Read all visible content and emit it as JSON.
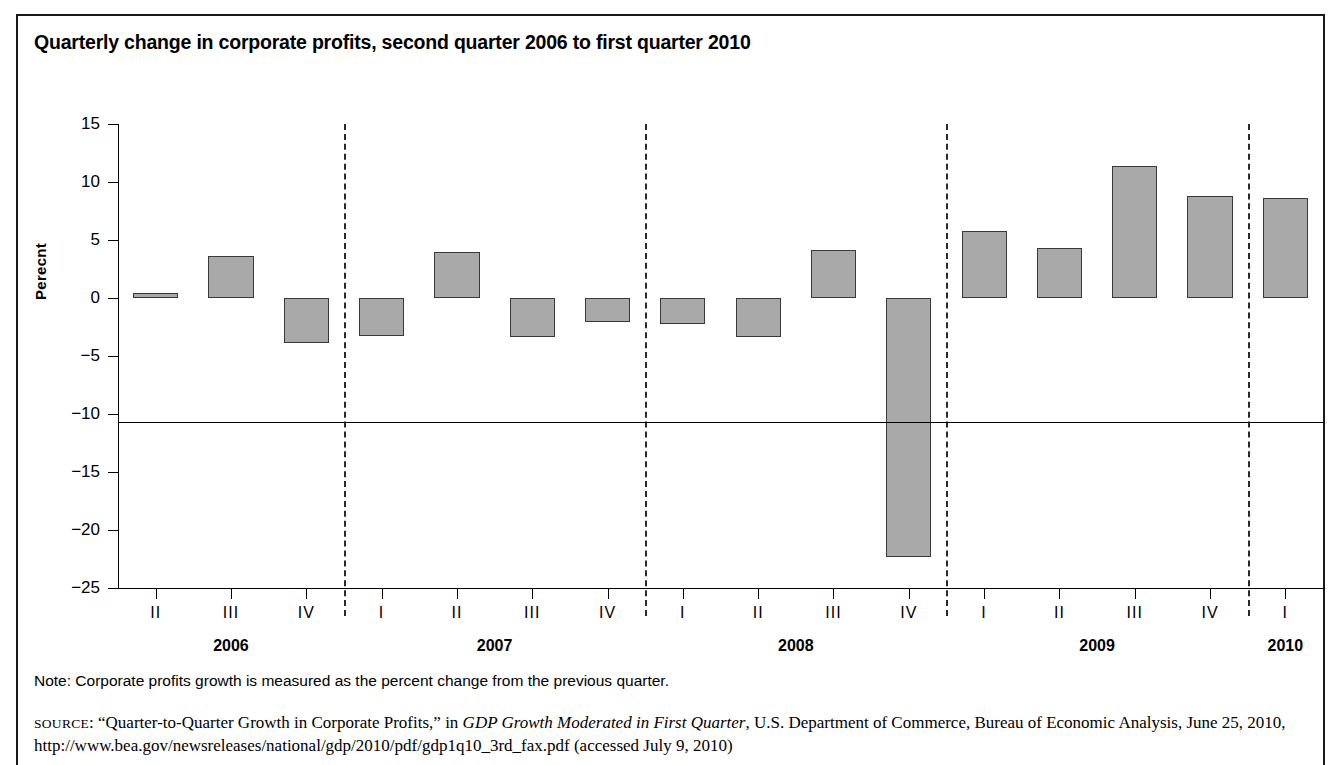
{
  "figure": {
    "title": "Quarterly change in corporate profits, second quarter 2006 to first quarter 2010",
    "axis_title": "Perecnt",
    "note": "Note: Corporate profits growth is measured as the percent change from the previous quarter.",
    "source": {
      "label": "SOURCE",
      "text_1": ": “Quarter-to-Quarter Growth in Corporate Profits,” in ",
      "italic_1": "GDP Growth Moderated in First Quarter",
      "text_2": ", U.S. Department of Commerce, Bureau of Economic Analysis, June 25, 2010, http://www.bea.gov/newsreleases/national/gdp/2010/pdf/gdp1q10_3rd_fax.pdf (accessed July 9, 2010)"
    },
    "colors": {
      "bar_fill": "#a9a9a9",
      "bar_stroke": "#3a3a3a",
      "axis": "#000000",
      "frame": "#1a1a1a",
      "separator": "#2a2a2a"
    }
  },
  "chart_data": {
    "type": "bar",
    "title": "Quarterly change in corporate profits, second quarter 2006 to first quarter 2010",
    "xlabel": "",
    "ylabel": "Perecnt",
    "ylim": [
      -25,
      15
    ],
    "yticks": [
      15,
      10,
      5,
      0,
      "−5",
      "−10",
      "−15",
      "−20",
      "−25"
    ],
    "ytick_values": [
      15,
      10,
      5,
      0,
      -5,
      -10,
      -15,
      -20,
      -25
    ],
    "grid": false,
    "legend": "none",
    "categories": [
      "II",
      "III",
      "IV",
      "I",
      "II",
      "III",
      "IV",
      "I",
      "II",
      "III",
      "IV",
      "I",
      "II",
      "III",
      "IV",
      "I"
    ],
    "values": [
      0.4,
      3.6,
      -3.9,
      -3.3,
      4.0,
      -3.4,
      -2.1,
      -2.2,
      -3.4,
      4.1,
      -22.3,
      5.8,
      4.3,
      11.4,
      8.8,
      8.6
    ],
    "year_groups": [
      {
        "year": "2006",
        "quarters": [
          "II",
          "III",
          "IV"
        ],
        "start_index": 0,
        "count": 3
      },
      {
        "year": "2007",
        "quarters": [
          "I",
          "II",
          "III",
          "IV"
        ],
        "start_index": 3,
        "count": 4
      },
      {
        "year": "2008",
        "quarters": [
          "I",
          "II",
          "III",
          "IV"
        ],
        "start_index": 7,
        "count": 4
      },
      {
        "year": "2009",
        "quarters": [
          "I",
          "II",
          "III",
          "IV"
        ],
        "start_index": 11,
        "count": 4
      },
      {
        "year": "2010",
        "quarters": [
          "I"
        ],
        "start_index": 15,
        "count": 1
      }
    ],
    "separators_after_index": [
      2,
      6,
      10,
      14
    ]
  }
}
